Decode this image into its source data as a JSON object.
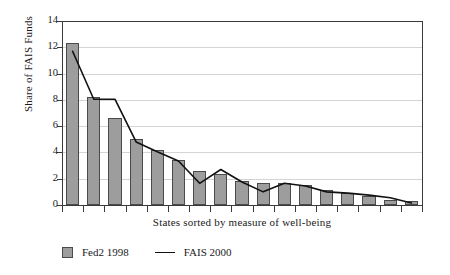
{
  "chart_data": {
    "type": "bar",
    "title": "",
    "subtitle": "",
    "xlabel": "States sorted by measure of well-being",
    "ylabel": "Share of FAIS Funds",
    "ylim": [
      0,
      14
    ],
    "ytick_labels": [
      "0",
      "2",
      "4",
      "6",
      "8",
      "10",
      "12",
      "14"
    ],
    "yticks": [
      0,
      2,
      4,
      6,
      8,
      10,
      12,
      14
    ],
    "grid": "horizontal",
    "legend_position": "below-plot-left",
    "xtick_labels": [],
    "categories": [
      "1",
      "2",
      "3",
      "4",
      "5",
      "6",
      "7",
      "8",
      "9",
      "10",
      "11",
      "12",
      "13",
      "14",
      "15",
      "16",
      "17"
    ],
    "series": [
      {
        "name": "Fed2 1998",
        "type": "bar",
        "color": "#9d9d9d",
        "edge_color": "#4a4a4a",
        "values": [
          12.35,
          8.25,
          6.6,
          5.0,
          4.15,
          3.45,
          2.6,
          2.35,
          1.85,
          1.7,
          1.65,
          1.5,
          1.15,
          0.95,
          0.7,
          0.35,
          0.3
        ]
      },
      {
        "name": "FAIS 2000",
        "type": "line",
        "color": "#111111",
        "values": [
          11.7,
          8.05,
          8.05,
          4.8,
          4.05,
          3.35,
          1.65,
          2.7,
          1.75,
          1.0,
          1.65,
          1.45,
          1.0,
          0.9,
          0.75,
          0.55,
          0.15
        ]
      }
    ]
  },
  "legend": {
    "items": [
      {
        "label": "Fed2 1998",
        "marker": "square-swatch-icon"
      },
      {
        "label": "FAIS 2000",
        "marker": "line-swatch-icon"
      }
    ]
  },
  "axes": {
    "y_title": "Share of FAIS Funds",
    "x_title": "States sorted by measure of well-being"
  }
}
